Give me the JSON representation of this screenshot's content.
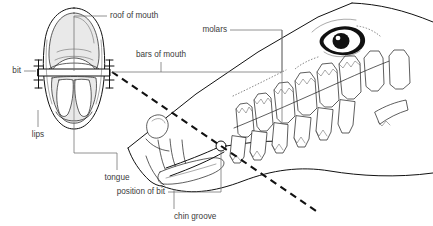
{
  "figure": {
    "width": 433,
    "height": 226,
    "background_color": "#ffffff",
    "ink_color": "#111111",
    "label_color": "#3b3b3b",
    "leader_color": "#6f6f6f"
  },
  "labels": {
    "roof_of_mouth": "roof of mouth",
    "bars_of_mouth": "bars of mouth",
    "molars": "molars",
    "bit": "bit",
    "lips": "lips",
    "tongue": "tongue",
    "position_of_bit": "position of bit",
    "chin_groove": "chin groove"
  },
  "views": {
    "front_view_name": "frontal cross-section of mouth with bit",
    "profile_view_name": "side view of horse head showing teeth and eye"
  },
  "parts": {
    "eye": "eye",
    "teeth": "teeth row",
    "mouth_corner": "mouth corner",
    "bit_pivot": "bit ring pivot point",
    "nostril": "nostril"
  }
}
